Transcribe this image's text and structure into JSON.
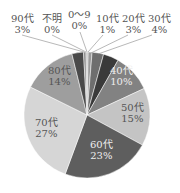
{
  "chart_data": {
    "type": "pie",
    "title": "",
    "categories": [
      "0～9",
      "10代",
      "20代",
      "30代",
      "40代",
      "50代",
      "60代",
      "70代",
      "80代",
      "90代",
      "不明"
    ],
    "values": [
      0,
      1,
      3,
      4,
      10,
      15,
      23,
      27,
      14,
      3,
      0
    ],
    "value_labels": [
      "0%",
      "1%",
      "3%",
      "4%",
      "10%",
      "15%",
      "23%",
      "27%",
      "14%",
      "3%",
      "0%"
    ],
    "colors": [
      "#bdbdbd",
      "#9a9a9a",
      "#6e6e6e",
      "#3a3a3a",
      "#828282",
      "#c4c4c4",
      "#5e5e5e",
      "#d6d6d6",
      "#9e9e9e",
      "#4a4a4a",
      "#8a8a8a"
    ],
    "legend": "none",
    "start_angle_deg": 0,
    "direction": "clockwise"
  },
  "labels": {
    "l0": {
      "name": "0～9",
      "pct": "0%"
    },
    "l10": {
      "name": "10代",
      "pct": "1%"
    },
    "l20": {
      "name": "20代",
      "pct": "3%"
    },
    "l30": {
      "name": "30代",
      "pct": "4%"
    },
    "l40": {
      "name": "40代",
      "pct": "10%"
    },
    "l50": {
      "name": "50代",
      "pct": "15%"
    },
    "l60": {
      "name": "60代",
      "pct": "23%"
    },
    "l70": {
      "name": "70代",
      "pct": "27%"
    },
    "l80": {
      "name": "80代",
      "pct": "14%"
    },
    "l90": {
      "name": "90代",
      "pct": "3%"
    },
    "lunk": {
      "name": "不明",
      "pct": "0%"
    }
  }
}
